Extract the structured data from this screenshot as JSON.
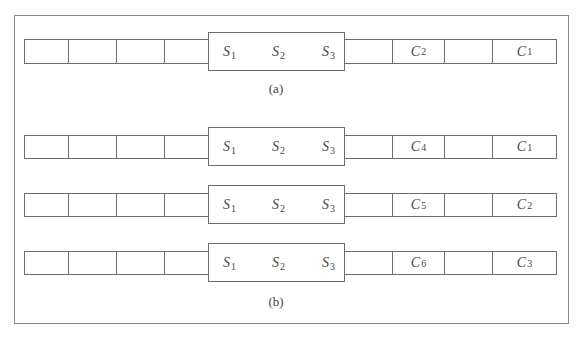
{
  "figure": {
    "caption_a": "(a)",
    "caption_b": "(b)",
    "window_symbols": [
      {
        "base": "S",
        "sub": "1"
      },
      {
        "base": "S",
        "sub": "2"
      },
      {
        "base": "S",
        "sub": "3"
      }
    ],
    "rows": [
      {
        "id": "a",
        "right_cells": [
          {
            "base": "",
            "sub": ""
          },
          {
            "base": "C",
            "sub": "2"
          },
          {
            "base": "",
            "sub": ""
          },
          {
            "base": "C",
            "sub": "1"
          }
        ]
      },
      {
        "id": "b1",
        "right_cells": [
          {
            "base": "",
            "sub": ""
          },
          {
            "base": "C",
            "sub": "4"
          },
          {
            "base": "",
            "sub": ""
          },
          {
            "base": "C",
            "sub": "1"
          }
        ]
      },
      {
        "id": "b2",
        "right_cells": [
          {
            "base": "",
            "sub": ""
          },
          {
            "base": "C",
            "sub": "5"
          },
          {
            "base": "",
            "sub": ""
          },
          {
            "base": "C",
            "sub": "2"
          }
        ]
      },
      {
        "id": "b3",
        "right_cells": [
          {
            "base": "",
            "sub": ""
          },
          {
            "base": "C",
            "sub": "6"
          },
          {
            "base": "",
            "sub": ""
          },
          {
            "base": "C",
            "sub": "3"
          }
        ]
      }
    ],
    "colors": {
      "line": "#6e6e6e",
      "frame": "#8a8a8a",
      "text": "#444444"
    }
  }
}
